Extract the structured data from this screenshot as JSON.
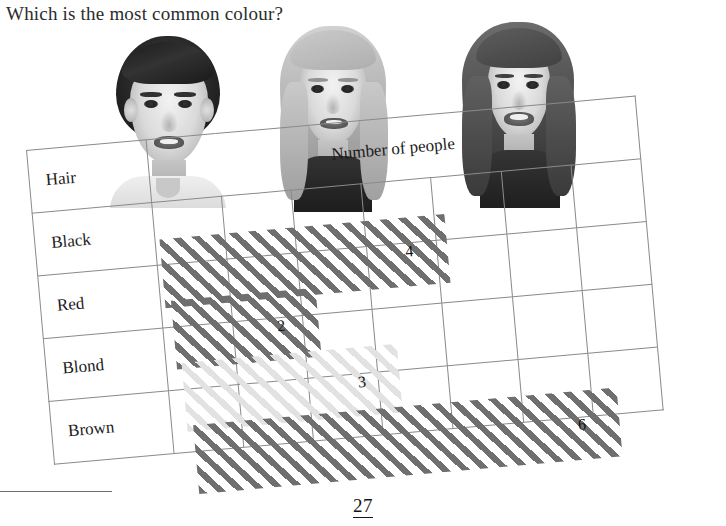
{
  "question": {
    "text": "Which is the most common colour?"
  },
  "photos": [
    {
      "name": "boy-dark-hair",
      "alt": "Boy with short dark brown hair"
    },
    {
      "name": "girl-blond-hair",
      "alt": "Girl with long blond hair"
    },
    {
      "name": "girl-brown-hair",
      "alt": "Girl with long brown hair"
    }
  ],
  "table": {
    "corner_label": "Hair",
    "column_header": "Number of people",
    "column_count": 7,
    "rows": [
      {
        "label": "Black",
        "value": 4,
        "value_label": "4",
        "fill": "dark"
      },
      {
        "label": "Red",
        "value": 2,
        "value_label": "2",
        "fill": "dark"
      },
      {
        "label": "Blond",
        "value": 3,
        "value_label": "3",
        "fill": "light"
      },
      {
        "label": "Brown",
        "value": 6,
        "value_label": "6",
        "fill": "dark"
      }
    ]
  },
  "footer": {
    "page_number": "27"
  },
  "colors": {
    "hatch_dark": "#6f6f6f",
    "hatch_light": "#e2e2e2",
    "grid_line": "#8a8a8a",
    "text": "#1a1a1a"
  },
  "chart_data": {
    "type": "bar",
    "title": "Number of people",
    "xlabel": "Number of people",
    "ylabel": "Hair",
    "categories": [
      "Black",
      "Red",
      "Blond",
      "Brown"
    ],
    "values": [
      4,
      2,
      3,
      6
    ],
    "xlim": [
      0,
      7
    ],
    "grid": true,
    "orientation": "horizontal",
    "legend": "none"
  }
}
